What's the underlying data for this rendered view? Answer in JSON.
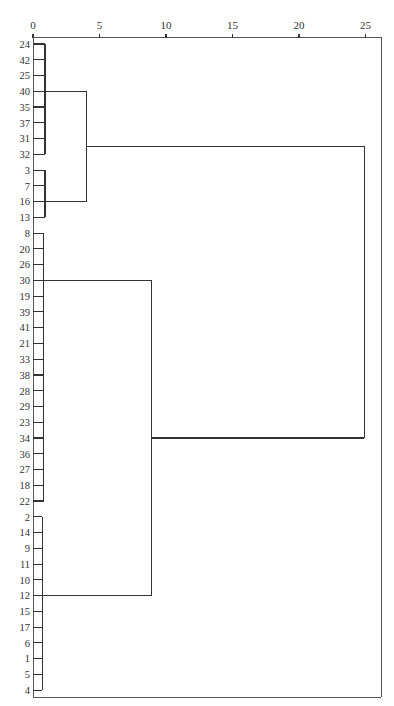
{
  "chart_data": {
    "type": "dendrogram",
    "title": "",
    "orientation": "horizontal",
    "xlabel": "",
    "ylabel": "",
    "x_axis": {
      "position": "top",
      "range": [
        0,
        25
      ],
      "ticks": [
        0,
        5,
        10,
        15,
        20,
        25
      ],
      "tick_labels": [
        "0",
        "5",
        "10",
        "15",
        "20",
        "25"
      ]
    },
    "leaves": [
      "24",
      "42",
      "25",
      "40",
      "35",
      "37",
      "31",
      "32",
      "3",
      "7",
      "16",
      "13",
      "8",
      "20",
      "26",
      "30",
      "19",
      "39",
      "41",
      "21",
      "33",
      "38",
      "28",
      "29",
      "23",
      "34",
      "36",
      "27",
      "18",
      "22",
      "2",
      "14",
      "9",
      "11",
      "10",
      "12",
      "15",
      "17",
      "6",
      "1",
      "5",
      "4"
    ],
    "clusters": [
      {
        "name": "A",
        "members": [
          "24",
          "42",
          "25",
          "40",
          "35",
          "37",
          "31",
          "32"
        ],
        "height": 0.9
      },
      {
        "name": "B",
        "members": [
          "3",
          "7",
          "16",
          "13"
        ],
        "height": 0.9
      },
      {
        "name": "C",
        "members": [
          "8",
          "20",
          "26",
          "30",
          "19",
          "39",
          "41",
          "21",
          "33",
          "38",
          "28",
          "29",
          "23",
          "34",
          "36",
          "27",
          "18",
          "22"
        ],
        "height": 0.8
      },
      {
        "name": "D",
        "members": [
          "2",
          "14",
          "9",
          "11",
          "10",
          "12",
          "15",
          "17",
          "6",
          "1",
          "5",
          "4"
        ],
        "height": 0.7
      }
    ],
    "merges": [
      {
        "left": "A",
        "right": "B",
        "height": 4.0,
        "name": "AB"
      },
      {
        "left": "C",
        "right": "D",
        "height": 8.9,
        "name": "CD"
      },
      {
        "left": "AB",
        "right": "CD",
        "height": 24.9,
        "name": "root"
      }
    ],
    "grid": false,
    "legend": null
  },
  "layout": {
    "x0": 33,
    "px_per_unit": 13.3,
    "leaf_y0": 44,
    "leaf_dy": 15.76,
    "frame": {
      "left": 33,
      "top": 37,
      "right": 381,
      "bottom": 697
    },
    "cluster_anchor_leaf": {
      "A": "40",
      "B": "16",
      "C": "30",
      "D": "12"
    }
  }
}
